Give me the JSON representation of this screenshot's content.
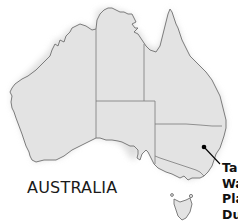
{
  "map": {
    "title": "AUSTRALIA",
    "colors": {
      "land": "#e3e3e3",
      "coastline": "#6f6f6f",
      "state_border": "#7a7a7a",
      "marker": "#000000",
      "background": "#ffffff"
    },
    "regions": [
      {
        "name": "western-australia"
      },
      {
        "name": "northern-territory"
      },
      {
        "name": "queensland"
      },
      {
        "name": "south-australia"
      },
      {
        "name": "new-south-wales"
      },
      {
        "name": "victoria"
      },
      {
        "name": "tasmania"
      }
    ],
    "marker": {
      "icon": "location-dot-icon",
      "callout_lines": [
        "Ta",
        "Wa",
        "Pla",
        "Du"
      ]
    }
  }
}
